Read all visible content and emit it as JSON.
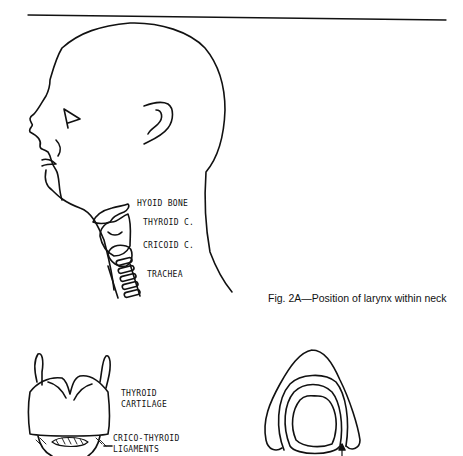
{
  "figure_2a": {
    "caption": "Fig. 2A—Position of larynx within neck",
    "labels": {
      "hyoid": "HYOID BONE",
      "thyroid": "THYROID C.",
      "cricoid": "CRICOID C.",
      "trachea": "TRACHEA"
    }
  },
  "figure_2b": {
    "labels": {
      "thyroid_cartilage_line1": "THYROID",
      "thyroid_cartilage_line2": "CARTILAGE",
      "crico_thyroid_line1": "CRICO-THYROID",
      "crico_thyroid_line2": "LIGAMENTS"
    }
  }
}
